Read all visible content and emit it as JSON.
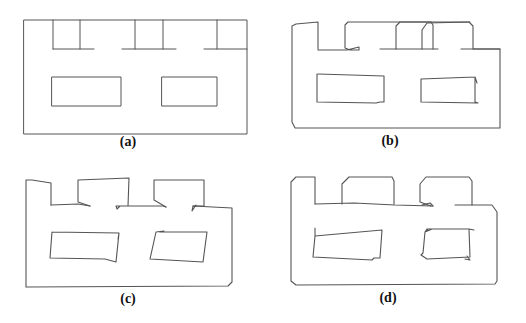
{
  "figure": {
    "stroke_color": "#555555",
    "panels": [
      {
        "id": "a",
        "label": "(a)",
        "label_pos": [
          128,
          135
        ],
        "paths": [
          {
            "name": "outer-boundary",
            "closed": true,
            "points": [
              [
                24,
                20
              ],
              [
                247,
                20
              ],
              [
                247,
                134
              ],
              [
                24,
                134
              ]
            ]
          },
          {
            "name": "room-1-left-wall",
            "closed": false,
            "points": [
              [
                53,
                20
              ],
              [
                53,
                49
              ]
            ]
          },
          {
            "name": "room-1-right-wall",
            "closed": false,
            "points": [
              [
                80,
                20
              ],
              [
                80,
                49
              ]
            ]
          },
          {
            "name": "room-1-floor",
            "closed": false,
            "points": [
              [
                53,
                49
              ],
              [
                94,
                49
              ]
            ]
          },
          {
            "name": "room-2-left-wall",
            "closed": false,
            "points": [
              [
                135,
                20
              ],
              [
                135,
                49
              ]
            ]
          },
          {
            "name": "room-2-right-wall",
            "closed": false,
            "points": [
              [
                163,
                20
              ],
              [
                163,
                49
              ]
            ]
          },
          {
            "name": "room-2-floor",
            "closed": false,
            "points": [
              [
                122,
                49
              ],
              [
                176,
                49
              ]
            ]
          },
          {
            "name": "room-3-left-wall",
            "closed": false,
            "points": [
              [
                217,
                20
              ],
              [
                217,
                49
              ]
            ]
          },
          {
            "name": "room-3-floor",
            "closed": false,
            "points": [
              [
                204,
                49
              ],
              [
                247,
                49
              ]
            ]
          },
          {
            "name": "inner-block-left",
            "closed": true,
            "points": [
              [
                52,
                77
              ],
              [
                121,
                77
              ],
              [
                121,
                106
              ],
              [
                52,
                106
              ]
            ]
          },
          {
            "name": "inner-block-right",
            "closed": true,
            "points": [
              [
                162,
                77
              ],
              [
                217,
                77
              ],
              [
                217,
                106
              ],
              [
                162,
                106
              ]
            ]
          }
        ]
      },
      {
        "id": "b",
        "label": "(b)",
        "label_pos": [
          390,
          134
        ],
        "paths": [
          {
            "name": "outer-trajectory",
            "closed": false,
            "points": [
              [
                318,
                49
              ],
              [
                318,
                22
              ],
              [
                296,
                24
              ],
              [
                292,
                26
              ],
              [
                292,
                122
              ],
              [
                295,
                128
              ],
              [
                500,
                128
              ],
              [
                500,
                49
              ],
              [
                473,
                49
              ],
              [
                473,
                26
              ],
              [
                469,
                22
              ],
              [
                348,
                22
              ],
              [
                345,
                25
              ],
              [
                345,
                48
              ],
              [
                350,
                50
              ],
              [
                359,
                50
              ],
              [
                359,
                47
              ],
              [
                347,
                50
              ],
              [
                318,
                50
              ]
            ]
          },
          {
            "name": "corridor-segment-1",
            "closed": false,
            "points": [
              [
                380,
                49
              ],
              [
                396,
                49
              ],
              [
                422,
                49
              ],
              [
                438,
                49
              ]
            ]
          },
          {
            "name": "room-2-loop",
            "closed": false,
            "points": [
              [
                396,
                49
              ],
              [
                396,
                26
              ],
              [
                400,
                22
              ],
              [
                431,
                22
              ],
              [
                433,
                25
              ],
              [
                433,
                49
              ]
            ]
          },
          {
            "name": "room-3-loop",
            "closed": false,
            "points": [
              [
                422,
                49
              ],
              [
                422,
                30
              ],
              [
                427,
                23
              ],
              [
                470,
                22
              ]
            ]
          },
          {
            "name": "corridor-segment-2",
            "closed": false,
            "points": [
              [
                461,
                49
              ],
              [
                500,
                49
              ]
            ]
          },
          {
            "name": "inner-loop-left",
            "closed": false,
            "points": [
              [
                318,
                74
              ],
              [
                384,
                76
              ],
              [
                384,
                102
              ],
              [
                380,
                102
              ],
              [
                376,
                103
              ],
              [
                317,
                102
              ],
              [
                317,
                74
              ]
            ]
          },
          {
            "name": "inner-loop-right",
            "closed": false,
            "points": [
              [
                421,
                79
              ],
              [
                475,
                77
              ],
              [
                477,
                83
              ],
              [
                475,
                77
              ],
              [
                475,
                102
              ],
              [
                478,
                103
              ],
              [
                421,
                102
              ],
              [
                421,
                79
              ]
            ]
          }
        ]
      },
      {
        "id": "c",
        "label": "(c)",
        "label_pos": [
          128,
          292
        ],
        "paths": [
          {
            "name": "outer-trajectory",
            "closed": false,
            "points": [
              [
                51,
                205
              ],
              [
                51,
                183
              ],
              [
                32,
                180
              ],
              [
                26,
                180
              ],
              [
                26,
                287
              ],
              [
                228,
                286
              ],
              [
                232,
                282
              ],
              [
                232,
                208
              ],
              [
                193,
                206
              ],
              [
                192,
                211
              ],
              [
                196,
                205
              ]
            ]
          },
          {
            "name": "room-1-floor",
            "closed": false,
            "points": [
              [
                51,
                205
              ],
              [
                78,
                204
              ],
              [
                90,
                206
              ]
            ]
          },
          {
            "name": "room-2-loop",
            "closed": false,
            "points": [
              [
                90,
                206
              ],
              [
                78,
                202
              ],
              [
                78,
                180
              ],
              [
                129,
                178
              ],
              [
                128,
                206
              ],
              [
                116,
                206
              ],
              [
                117,
                209
              ],
              [
                120,
                206
              ],
              [
                163,
                206
              ],
              [
                166,
                207
              ]
            ]
          },
          {
            "name": "room-3-loop",
            "closed": false,
            "points": [
              [
                166,
                207
              ],
              [
                154,
                200
              ],
              [
                154,
                180
              ],
              [
                204,
                180
              ],
              [
                204,
                206
              ],
              [
                193,
                206
              ]
            ]
          },
          {
            "name": "inner-loop-left",
            "closed": false,
            "points": [
              [
                52,
                232
              ],
              [
                119,
                233
              ],
              [
                118,
                239
              ],
              [
                119,
                233
              ],
              [
                116,
                262
              ],
              [
                105,
                259
              ],
              [
                50,
                258
              ],
              [
                52,
                232
              ]
            ]
          },
          {
            "name": "inner-loop-right",
            "closed": false,
            "points": [
              [
                164,
                231
              ],
              [
                156,
                232
              ],
              [
                150,
                259
              ],
              [
                203,
                262
              ],
              [
                207,
                232
              ],
              [
                160,
                232
              ]
            ]
          }
        ]
      },
      {
        "id": "d",
        "label": "(d)",
        "label_pos": [
          388,
          291
        ],
        "paths": [
          {
            "name": "outer-trajectory",
            "closed": false,
            "points": [
              [
                315,
                204
              ],
              [
                315,
                177
              ],
              [
                296,
                177
              ],
              [
                291,
                182
              ],
              [
                291,
                281
              ],
              [
                296,
                285
              ],
              [
                495,
                284
              ],
              [
                497,
                281
              ],
              [
                497,
                212
              ],
              [
                492,
                205
              ],
              [
                455,
                205
              ]
            ]
          },
          {
            "name": "corridor-floor",
            "closed": false,
            "points": [
              [
                315,
                204
              ],
              [
                354,
                203
              ],
              [
                395,
                205
              ],
              [
                433,
                206
              ]
            ]
          },
          {
            "name": "room-2-loop",
            "closed": false,
            "points": [
              [
                342,
                204
              ],
              [
                342,
                184
              ],
              [
                349,
                177
              ],
              [
                392,
                177
              ],
              [
                394,
                181
              ],
              [
                394,
                204
              ]
            ]
          },
          {
            "name": "room-3-loop",
            "closed": false,
            "points": [
              [
                431,
                206
              ],
              [
                420,
                202
              ],
              [
                420,
                184
              ],
              [
                426,
                177
              ],
              [
                469,
                177
              ],
              [
                472,
                181
              ],
              [
                472,
                205
              ]
            ]
          },
          {
            "name": "room-3-return",
            "closed": false,
            "points": [
              [
                422,
                205
              ],
              [
                430,
                203
              ],
              [
                433,
                206
              ]
            ]
          },
          {
            "name": "inner-loop-left",
            "closed": false,
            "points": [
              [
                315,
                228
              ],
              [
                315,
                236
              ],
              [
                382,
                230
              ],
              [
                380,
                258
              ],
              [
                374,
                258
              ],
              [
                372,
                260
              ],
              [
                313,
                257
              ],
              [
                315,
                236
              ]
            ]
          },
          {
            "name": "inner-loop-right",
            "closed": false,
            "points": [
              [
                428,
                229
              ],
              [
                425,
                232
              ],
              [
                423,
                253
              ],
              [
                421,
                255
              ],
              [
                427,
                259
              ],
              [
                470,
                257
              ],
              [
                469,
                229
              ],
              [
                474,
                230
              ],
              [
                469,
                229
              ],
              [
                427,
                229
              ],
              [
                425,
                232
              ],
              [
                432,
                229
              ]
            ]
          },
          {
            "name": "inner-loop-right-corner",
            "closed": false,
            "points": [
              [
                467,
                256
              ],
              [
                470,
                260
              ],
              [
                465,
                259
              ]
            ]
          }
        ]
      }
    ]
  }
}
